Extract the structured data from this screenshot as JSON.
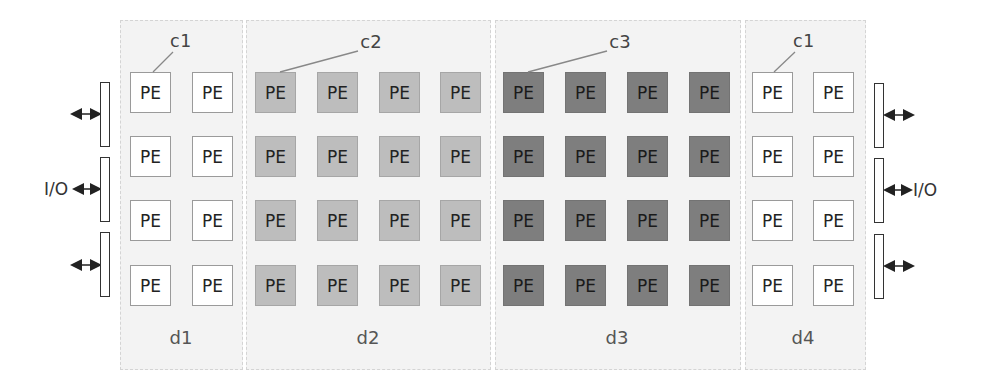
{
  "colors": {
    "region_bg": "#f3f3f3",
    "pe_white": "#ffffff",
    "pe_light": "#bdbdbd",
    "pe_dark": "#7e7e7e"
  },
  "pe_label": "PE",
  "regions": [
    {
      "id": "d1",
      "label": "d1",
      "cluster": "c1",
      "columns": 2,
      "shade": "white"
    },
    {
      "id": "d2",
      "label": "d2",
      "cluster": "c2",
      "columns": 4,
      "shade": "light"
    },
    {
      "id": "d3",
      "label": "d3",
      "cluster": "c3",
      "columns": 4,
      "shade": "dark"
    },
    {
      "id": "d4",
      "label": "d4",
      "cluster": "c1",
      "columns": 2,
      "shade": "white"
    }
  ],
  "rows": 4,
  "cluster_labels": [
    "c1",
    "c2",
    "c3",
    "c1"
  ],
  "io": {
    "left_label": "I/O",
    "right_label": "I/O",
    "ports_per_side": 3
  }
}
